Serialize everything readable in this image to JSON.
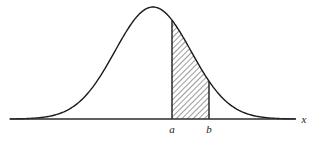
{
  "figure": {
    "kind": "statistical-diagram",
    "caption": "",
    "background_color": "#ffffff",
    "ink_color": "#1a1a1a"
  },
  "axis": {
    "name": "x-axis",
    "label": "x",
    "label_style": "italic",
    "color": "#2b2b2b",
    "start_x": 10,
    "end_x": 296,
    "baseline_y": 119
  },
  "tick_labels": [
    {
      "text": "a",
      "x": 172,
      "y": 133
    },
    {
      "text": "b",
      "x": 209,
      "y": 133
    }
  ],
  "curve": {
    "name": "normal-density-curve",
    "color": "#1a1a1a",
    "stroke_width": 1.4,
    "peak_x": 153,
    "peak_y": 7,
    "mean": 153,
    "sigma": 38
  },
  "shaded_region": {
    "name": "area-between-a-and-b",
    "hatch_color": "#3a3a3a",
    "hatch_angle_deg": 45,
    "hatch_spacing": 4,
    "left_boundary_x": 172,
    "right_boundary_x": 209,
    "left_boundary_top_y": 27,
    "right_boundary_top_y": 88,
    "bottom_y": 119
  },
  "chart_data": {
    "type": "area",
    "title": "",
    "xlabel": "x",
    "ylabel": "",
    "grid": false,
    "legend": null,
    "annotations": [
      "a",
      "b",
      "x"
    ],
    "series": [
      {
        "name": "normal density",
        "description": "bell-shaped normal probability density curve"
      }
    ],
    "shaded_interval": {
      "from": "a",
      "to": "b"
    }
  }
}
